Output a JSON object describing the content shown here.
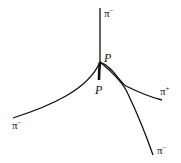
{
  "diagram": {
    "type": "particle-track-diagram",
    "vertex": {
      "x": 100,
      "y": 62
    },
    "stroke_color": "#111111",
    "tracks": [
      {
        "id": "pi-minus-up",
        "particle": "π",
        "charge": "−",
        "label": "π",
        "label_sup": "−"
      },
      {
        "id": "proton-incoming",
        "particle": "P",
        "label": "P"
      },
      {
        "id": "pi-minus-left",
        "particle": "π",
        "charge": "−",
        "label": "π",
        "label_sup": "−"
      },
      {
        "id": "pi-plus-right",
        "particle": "π",
        "charge": "+",
        "label": "π",
        "label_sup": "+"
      },
      {
        "id": "pi-minus-lower-right",
        "particle": "π",
        "charge": "−",
        "label": "π",
        "label_sup": "−"
      }
    ],
    "vertex_label": "P"
  }
}
